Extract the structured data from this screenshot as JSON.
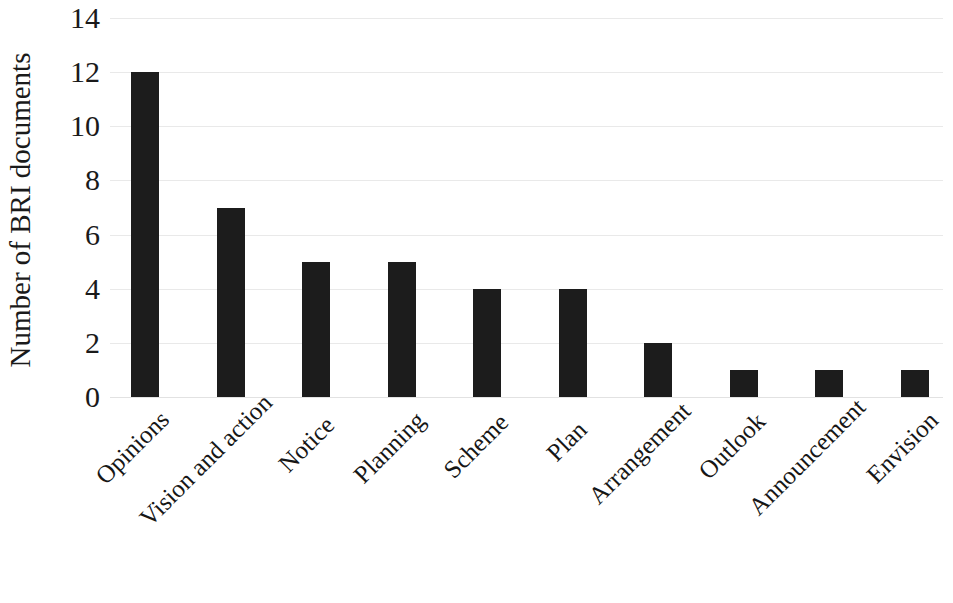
{
  "chart_data": {
    "type": "bar",
    "title": "",
    "subtitle": "",
    "xlabel": "",
    "ylabel": "Number of BRI documents",
    "categories": [
      "Opinions",
      "Vision and action",
      "Notice",
      "Planning",
      "Scheme",
      "Plan",
      "Arrangement",
      "Outlook",
      "Announcement",
      "Envision"
    ],
    "values": [
      12,
      7,
      5,
      5,
      4,
      4,
      2,
      1,
      1,
      1
    ],
    "ylim": [
      0,
      14
    ],
    "yticks": [
      0,
      2,
      4,
      6,
      8,
      10,
      12,
      14
    ],
    "ytick_labels": [
      "0",
      "2",
      "4",
      "6",
      "8",
      "10",
      "12",
      "14"
    ],
    "grid": true,
    "grid_axis": "y",
    "legend": false,
    "legend_position": "none",
    "bar_color": "#1c1c1c",
    "grid_color": "#e9e9e9",
    "background_color": "#ffffff",
    "xtick_rotation_degrees": -45
  }
}
